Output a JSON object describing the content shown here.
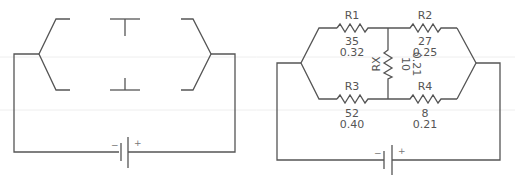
{
  "left_diagram": {
    "title": "blank circuit template",
    "battery": {
      "minus_label": "−",
      "plus_label": "+"
    }
  },
  "right_diagram": {
    "resistors": [
      {
        "id": "R1",
        "label": "R1",
        "resistance": "35",
        "current": "0.32"
      },
      {
        "id": "R2",
        "label": "R2",
        "resistance": "27",
        "current": "0.25"
      },
      {
        "id": "RX",
        "label": "RX",
        "resistance": "10",
        "current": "0.21"
      },
      {
        "id": "R3",
        "label": "R3",
        "resistance": "52",
        "current": "0.40"
      },
      {
        "id": "R4",
        "label": "R4",
        "resistance": "8",
        "current": "0.21"
      }
    ],
    "battery": {
      "minus_label": "−",
      "plus_label": "+"
    }
  },
  "colors": {
    "wire": "#555555",
    "text": "#555555",
    "background": "#ffffff"
  }
}
